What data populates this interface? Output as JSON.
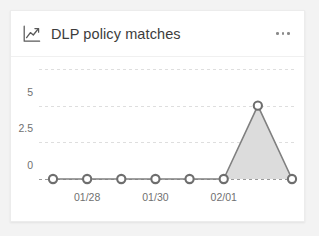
{
  "card": {
    "title": "DLP policy matches",
    "icon": "line-chart-icon",
    "overflow_label": "...",
    "background": "#ffffff",
    "page_background": "#f3f3f3"
  },
  "chart_data": {
    "type": "line",
    "title": "DLP policy matches",
    "xlabel": "",
    "ylabel": "",
    "x": [
      "01/27",
      "01/28",
      "01/29",
      "01/30",
      "01/31",
      "02/01",
      "02/02",
      "02/03"
    ],
    "values": [
      0,
      0,
      0,
      0,
      0,
      0,
      5,
      0
    ],
    "series": [
      {
        "name": "DLP policy matches",
        "values": [
          0,
          0,
          0,
          0,
          0,
          0,
          5,
          0
        ],
        "line_color": "#808080",
        "area_color": "#dcdcdc",
        "marker_color": "#6e6e6e"
      }
    ],
    "ylim": [
      0,
      7.5
    ],
    "yticks": [
      0,
      2.5,
      5
    ],
    "ytick_labels": [
      "0",
      "2.5",
      "5"
    ],
    "xtick_indices": [
      1,
      3,
      5
    ],
    "xtick_labels": [
      "01/28",
      "01/30",
      "02/01"
    ],
    "gridlines": [
      0,
      2.5,
      5,
      7.5
    ],
    "grid": true,
    "grid_style": "dashed",
    "grid_color": "#dedede",
    "legend": false,
    "markers": "hollow-circle",
    "area_fill": true
  }
}
